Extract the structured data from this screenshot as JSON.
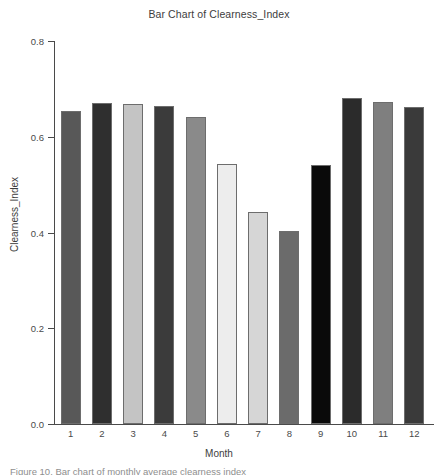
{
  "chart_data": {
    "type": "bar",
    "title": "Bar Chart of Clearness_Index",
    "xlabel": "Month",
    "ylabel": "Clearness_Index",
    "categories": [
      "1",
      "2",
      "3",
      "4",
      "5",
      "6",
      "7",
      "8",
      "9",
      "10",
      "11",
      "12"
    ],
    "values": [
      0.654,
      0.671,
      0.668,
      0.664,
      0.641,
      0.543,
      0.443,
      0.403,
      0.541,
      0.681,
      0.673,
      0.662
    ],
    "bar_colors": [
      "#585858",
      "#2f2f2f",
      "#c4c4c4",
      "#3b3b3b",
      "#8a8a8a",
      "#ededed",
      "#d6d6d6",
      "#6b6b6b",
      "#0a0a0a",
      "#2b2b2b",
      "#7f7f7f",
      "#3a3a3a"
    ],
    "ylim": [
      0.0,
      0.8
    ],
    "yticks": [
      "0.0",
      "0.2",
      "0.4",
      "0.6",
      "0.8"
    ],
    "ytick_values": [
      0.0,
      0.2,
      0.4,
      0.6,
      0.8
    ],
    "grid": false,
    "legend": false,
    "axis_color": "#4a4a4a",
    "bar_edge_color": "#6d6d6d",
    "background": "#ffffff"
  },
  "caption": {
    "text": "Figure 10. Bar chart of monthly average clearness index"
  }
}
